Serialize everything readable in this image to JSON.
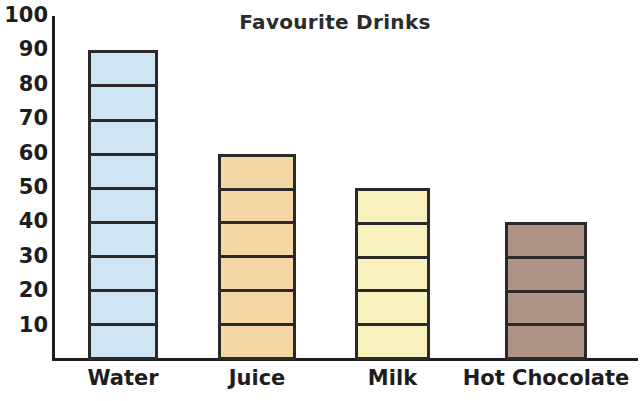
{
  "chart_data": {
    "type": "bar",
    "title": "Favourite Drinks",
    "categories": [
      "Water",
      "Juice",
      "Milk",
      "Hot Chocolate"
    ],
    "values": [
      90,
      60,
      50,
      40
    ],
    "xlabel": "",
    "ylabel": "",
    "ylim": [
      0,
      100
    ],
    "y_tick_step": 10,
    "y_ticks": [
      "100",
      "90",
      "80",
      "70",
      "60",
      "50",
      "40",
      "30",
      "20",
      "10"
    ],
    "grid": false,
    "legend": false,
    "segment_unit": 10,
    "bar_colors": [
      "#cfe5f3",
      "#f5d6a5",
      "#f8f0bd",
      "#b09387"
    ],
    "bar_border_color": "#2a2a2a",
    "axis_color": "#1d1d1d",
    "text_color": "#1d1d1d",
    "background": "#ffffff"
  }
}
